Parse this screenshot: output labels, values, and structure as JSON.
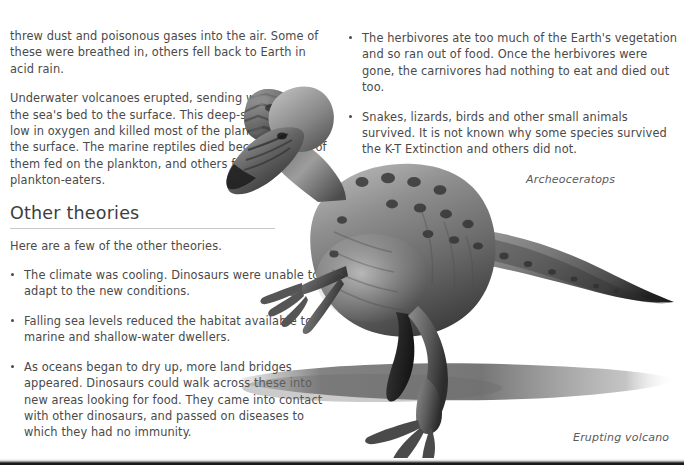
{
  "page": {
    "background_color": "#ffffff",
    "text_color": "#4a4a4a",
    "rule_color": "#c9c9c9"
  },
  "left_column": {
    "paragraphs": [
      "threw dust and poisonous gases into the air. Some of these were breathed in, others fell back to Earth in acid rain.",
      "Underwater volcanoes erupted, sending water from the sea's bed to the surface. This deep-sea water was low in oxygen and killed most of the plankton living at the surface. The marine reptiles died because some of them fed on the plankton, and others fed on the plankton-eaters."
    ],
    "section": {
      "heading": "Other theories",
      "intro": "Here are a few of the other theories.",
      "bullets": [
        "The climate was cooling. Dinosaurs were unable to adapt to the new conditions.",
        "Falling sea levels reduced the habitat available to marine and shallow-water dwellers.",
        "As oceans began to dry up, more land bridges appeared. Dinosaurs could walk across these into new areas looking for food. They came into contact with other dinosaurs, and passed on diseases to which they had no immunity."
      ]
    }
  },
  "right_column": {
    "bullets": [
      "The herbivores ate too much of the Earth's vegetation and so ran out of food. Once the herbivores were gone, the carnivores had nothing to eat and died out too.",
      "Snakes, lizards, birds and other small animals survived. It is not known why some species survived the K-T Extinction and others did not."
    ]
  },
  "figures": {
    "dinosaur": {
      "caption": "Archeoceratops",
      "alt": "Grayscale photograph of a spotted bipedal dinosaur standing with a long tapering tail and a cast shadow"
    },
    "volcano": {
      "caption": "Erupting volcano",
      "alt": "Small grayscale photograph of an erupting volcano"
    }
  }
}
